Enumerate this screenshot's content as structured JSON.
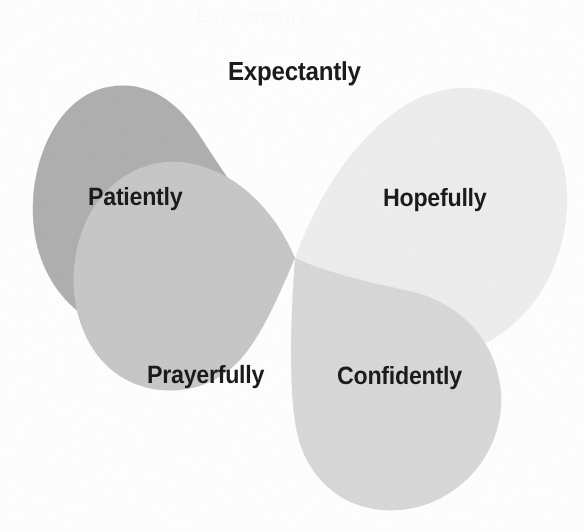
{
  "diagram": {
    "type": "petal-pinwheel",
    "title": "Expectantly",
    "background_color": "#ffffff",
    "label_color": "#1b1b1b",
    "center_point": {
      "x": 295,
      "y": 258
    },
    "petals": [
      {
        "id": "patiently",
        "label": "Patiently",
        "position": "upper-left",
        "fill_color": "#b0b0b0",
        "tone": "darkest"
      },
      {
        "id": "hopefully",
        "label": "Hopefully",
        "position": "upper-right",
        "fill_color": "#eeeeee",
        "tone": "lightest"
      },
      {
        "id": "prayerfully",
        "label": "Prayerfully",
        "position": "lower-left",
        "fill_color": "#c8c8c8",
        "tone": "mid-light"
      },
      {
        "id": "confidently",
        "label": "Confidently",
        "position": "lower-right",
        "fill_color": "#d9d9d9",
        "tone": "light"
      }
    ],
    "artifact": {
      "ghost_text": "Expectantly"
    }
  }
}
